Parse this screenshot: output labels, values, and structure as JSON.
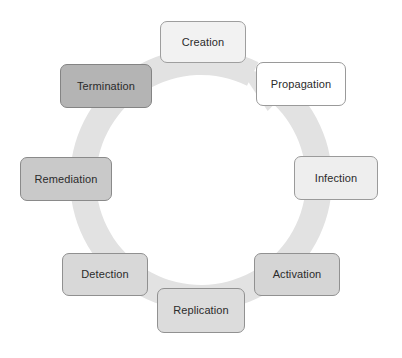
{
  "diagram": {
    "type": "cycle",
    "title": "",
    "background_color": "#ffffff",
    "ring": {
      "name": "circular-arrow",
      "color": "#e2e2e2",
      "direction": "clockwise",
      "center_x": 201,
      "center_y": 180,
      "radius": 118,
      "thickness": 26,
      "arrowhead_angle_deg": -62
    },
    "nodes": [
      {
        "id": "creation",
        "label": "Creation",
        "fill": "#f2f2f2",
        "border": "#9e9e9e",
        "text_color": "#2b2b2b",
        "x": 160,
        "y": 21,
        "width": 86,
        "height": 42,
        "angle_deg": -90,
        "order": 1
      },
      {
        "id": "propagation",
        "label": "Propagation",
        "fill": "#ffffff",
        "border": "#9a9a9a",
        "text_color": "#2b2b2b",
        "x": 256,
        "y": 62,
        "width": 90,
        "height": 44,
        "angle_deg": -45,
        "order": 2
      },
      {
        "id": "infection",
        "label": "Infection",
        "fill": "#eeeeee",
        "border": "#9a9a9a",
        "text_color": "#2b2b2b",
        "x": 294,
        "y": 156,
        "width": 84,
        "height": 44,
        "angle_deg": 0,
        "order": 3
      },
      {
        "id": "activation",
        "label": "Activation",
        "fill": "#d5d5d5",
        "border": "#919191",
        "text_color": "#2b2b2b",
        "x": 254,
        "y": 253,
        "width": 86,
        "height": 43,
        "angle_deg": 45,
        "order": 4
      },
      {
        "id": "replication",
        "label": "Replication",
        "fill": "#dcdcdc",
        "border": "#919191",
        "text_color": "#2b2b2b",
        "x": 157,
        "y": 288,
        "width": 88,
        "height": 45,
        "angle_deg": 90,
        "order": 5
      },
      {
        "id": "detection",
        "label": "Detection",
        "fill": "#d8d8d8",
        "border": "#909090",
        "text_color": "#2b2b2b",
        "x": 62,
        "y": 253,
        "width": 86,
        "height": 43,
        "angle_deg": 135,
        "order": 6
      },
      {
        "id": "remediation",
        "label": "Remediation",
        "fill": "#c9c9c9",
        "border": "#8a8a8a",
        "text_color": "#2b2b2b",
        "x": 20,
        "y": 157,
        "width": 92,
        "height": 44,
        "angle_deg": 180,
        "order": 7
      },
      {
        "id": "termination",
        "label": "Termination",
        "fill": "#b4b4b4",
        "border": "#848484",
        "text_color": "#2b2b2b",
        "x": 60,
        "y": 64,
        "width": 92,
        "height": 44,
        "angle_deg": -135,
        "order": 8
      }
    ]
  }
}
